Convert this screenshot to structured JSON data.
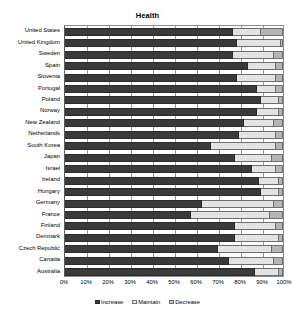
{
  "chart_data": {
    "type": "bar",
    "orientation": "horizontal",
    "stacked": true,
    "stack_normalized_percent": true,
    "title": "Health",
    "xlabel": "",
    "ylabel": "",
    "xlim": [
      0,
      100
    ],
    "xtick_labels": [
      "0%",
      "10%",
      "20%",
      "30%",
      "40%",
      "50%",
      "60%",
      "70%",
      "80%",
      "90%",
      "100%"
    ],
    "xticks": [
      0,
      10,
      20,
      30,
      40,
      50,
      60,
      70,
      80,
      90,
      100
    ],
    "grid": true,
    "grid_axis": "x",
    "legend_position": "bottom",
    "legend_entries": [
      "Increase",
      "Maintain",
      "Decrease"
    ],
    "categories": [
      "United States",
      "United Kingdom",
      "Sweden",
      "Spain",
      "Slovenia",
      "Portugal",
      "Poland",
      "Norway",
      "New Zealand",
      "Netherlands",
      "South Korea",
      "Japan",
      "Israel",
      "Ireland",
      "Hungary",
      "Germany",
      "France",
      "Finland",
      "Denmark",
      "Czech Republic",
      "Canada",
      "Australia"
    ],
    "series": [
      {
        "name": "Increase",
        "color": "#3a3a3a",
        "values": [
          77,
          79,
          77,
          84,
          79,
          88,
          90,
          88,
          82,
          80,
          67,
          78,
          86,
          89,
          90,
          63,
          58,
          78,
          78,
          70,
          75,
          87
        ]
      },
      {
        "name": "Maintain",
        "color": "#e3e3e3",
        "values": [
          13,
          20,
          19,
          13,
          18,
          9,
          8,
          10,
          14,
          17,
          30,
          17,
          11,
          9,
          8,
          33,
          36,
          19,
          20,
          25,
          21,
          11
        ]
      },
      {
        "name": "Decrease",
        "color": "#b5b5b5",
        "values": [
          10,
          1,
          4,
          3,
          3,
          3,
          2,
          2,
          4,
          3,
          3,
          5,
          3,
          2,
          2,
          4,
          6,
          3,
          2,
          5,
          4,
          2
        ]
      }
    ]
  },
  "colors": {
    "increase": "#3a3a3a",
    "maintain": "#e3e3e3",
    "decrease": "#b5b5b5",
    "axis": "#8c8c8c",
    "grid": "#9a9a9a",
    "text": "#000000",
    "background": "#ffffff"
  }
}
